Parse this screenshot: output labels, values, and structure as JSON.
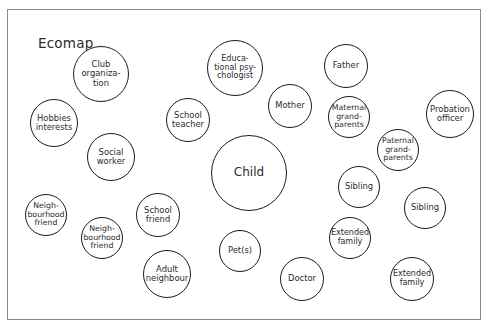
{
  "diagram": {
    "title": "Ecomap",
    "type": "ecomap",
    "frame": {
      "border_color": "#8a8a8a",
      "background": "#ffffff"
    },
    "node_style": {
      "stroke": "#1b1b1b",
      "fill": "#ffffff",
      "text_color": "#2b2b2b"
    },
    "nodes": [
      {
        "label": "Club\norganiza-\ntion",
        "cx": 100,
        "cy": 73,
        "r": 28,
        "fs": 8.4
      },
      {
        "label": "Educa-\ntional psy-\nchologist",
        "cx": 234,
        "cy": 67,
        "r": 28,
        "fs": 8.0
      },
      {
        "label": "Father",
        "cx": 345,
        "cy": 65,
        "r": 22,
        "fs": 8.4
      },
      {
        "label": "Hobbies\ninterests",
        "cx": 53,
        "cy": 122,
        "r": 24,
        "fs": 8.4
      },
      {
        "label": "School\nteacher",
        "cx": 187,
        "cy": 119,
        "r": 22,
        "fs": 8.4
      },
      {
        "label": "Mother",
        "cx": 289,
        "cy": 105,
        "r": 22,
        "fs": 8.4
      },
      {
        "label": "Maternal\ngrand-\nparents",
        "cx": 348,
        "cy": 116,
        "r": 21,
        "fs": 7.8
      },
      {
        "label": "Probation\nofficer",
        "cx": 449,
        "cy": 113,
        "r": 24,
        "fs": 8.4
      },
      {
        "label": "Paternal\ngrand-\nparents",
        "cx": 397,
        "cy": 149,
        "r": 21,
        "fs": 7.8
      },
      {
        "label": "Social\nworker",
        "cx": 110,
        "cy": 156,
        "r": 24,
        "fs": 8.4
      },
      {
        "label": "Child",
        "cx": 248,
        "cy": 172,
        "r": 38,
        "fs": 12.0
      },
      {
        "label": "Sibling",
        "cx": 358,
        "cy": 186,
        "r": 21,
        "fs": 8.4
      },
      {
        "label": "Sibling",
        "cx": 424,
        "cy": 207,
        "r": 21,
        "fs": 8.4
      },
      {
        "label": "Neigh-\nbourhood\nfriend",
        "cx": 45,
        "cy": 214,
        "r": 21,
        "fs": 7.8
      },
      {
        "label": "School\nfriend",
        "cx": 157,
        "cy": 214,
        "r": 22,
        "fs": 8.4
      },
      {
        "label": "Neigh-\nbourhood\nfriend",
        "cx": 101,
        "cy": 237,
        "r": 21,
        "fs": 7.8
      },
      {
        "label": "Extended\nfamily",
        "cx": 349,
        "cy": 237,
        "r": 21,
        "fs": 8.0
      },
      {
        "label": "Pet(s)",
        "cx": 239,
        "cy": 250,
        "r": 21,
        "fs": 8.4
      },
      {
        "label": "Adult\nneighbour",
        "cx": 166,
        "cy": 273,
        "r": 24,
        "fs": 8.4
      },
      {
        "label": "Doctor",
        "cx": 301,
        "cy": 278,
        "r": 22,
        "fs": 8.4
      },
      {
        "label": "Extended\nfamily",
        "cx": 411,
        "cy": 278,
        "r": 22,
        "fs": 8.0
      }
    ]
  }
}
